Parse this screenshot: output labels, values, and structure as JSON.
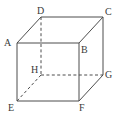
{
  "figure": {
    "name": "labelled-cube-diagram",
    "type": "geometric-solid",
    "solid": "cube",
    "background_color": "#ffffff",
    "stroke_color": "#4d4d4d",
    "label_color": "#3a3a3a",
    "stroke_width": 1,
    "hidden_edge_style": "dashed",
    "visible_edge_style": "solid",
    "vertices": [
      {
        "id": "A",
        "label": "A",
        "x": 17,
        "y": 43,
        "hidden": false,
        "label_x": 4,
        "label_y": 38
      },
      {
        "id": "B",
        "label": "B",
        "x": 79,
        "y": 43,
        "hidden": false,
        "label_x": 81,
        "label_y": 45
      },
      {
        "id": "C",
        "label": "C",
        "x": 103,
        "y": 17,
        "hidden": false,
        "label_x": 105,
        "label_y": 7
      },
      {
        "id": "D",
        "label": "D",
        "x": 41,
        "y": 17,
        "hidden": false,
        "label_x": 37,
        "label_y": 6
      },
      {
        "id": "E",
        "label": "E",
        "x": 17,
        "y": 101,
        "hidden": false,
        "label_x": 8,
        "label_y": 103
      },
      {
        "id": "F",
        "label": "F",
        "x": 79,
        "y": 101,
        "hidden": false,
        "label_x": 79,
        "label_y": 103
      },
      {
        "id": "G",
        "label": "G",
        "x": 103,
        "y": 75,
        "hidden": false,
        "label_x": 105,
        "label_y": 70
      },
      {
        "id": "H",
        "label": "H",
        "x": 41,
        "y": 75,
        "hidden": true,
        "label_x": 31,
        "label_y": 65
      }
    ],
    "edges": [
      {
        "id": "AB",
        "from": "A",
        "to": "B",
        "hidden": false
      },
      {
        "id": "AD",
        "from": "A",
        "to": "D",
        "hidden": false
      },
      {
        "id": "AE",
        "from": "A",
        "to": "E",
        "hidden": false
      },
      {
        "id": "DC",
        "from": "D",
        "to": "C",
        "hidden": false
      },
      {
        "id": "BC",
        "from": "B",
        "to": "C",
        "hidden": false
      },
      {
        "id": "BF",
        "from": "B",
        "to": "F",
        "hidden": false
      },
      {
        "id": "CG",
        "from": "C",
        "to": "G",
        "hidden": false
      },
      {
        "id": "EF",
        "from": "E",
        "to": "F",
        "hidden": false
      },
      {
        "id": "FG",
        "from": "F",
        "to": "G",
        "hidden": false
      },
      {
        "id": "DH",
        "from": "D",
        "to": "H",
        "hidden": true
      },
      {
        "id": "HG",
        "from": "H",
        "to": "G",
        "hidden": true
      },
      {
        "id": "HE",
        "from": "H",
        "to": "E",
        "hidden": true
      }
    ]
  }
}
